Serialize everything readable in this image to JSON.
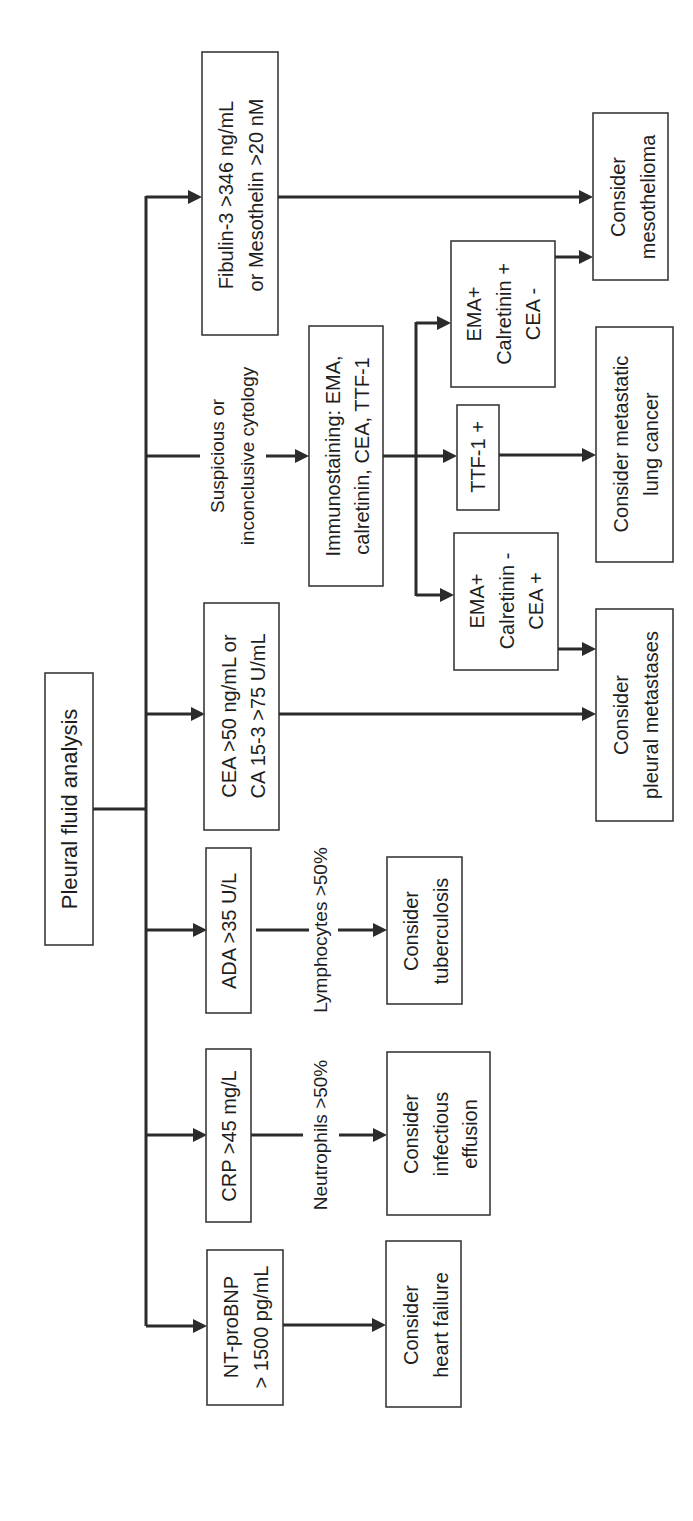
{
  "diagram": {
    "orientation": "rotated-90-ccw",
    "root": {
      "label": "Pleural fluid analysis"
    },
    "branches": [
      {
        "test": [
          "NT-proBNP",
          "> 1500 pg/mL"
        ],
        "edge_label": "",
        "outcome": [
          "Consider",
          "heart failure"
        ]
      },
      {
        "test": [
          "CRP >45 mg/L"
        ],
        "edge_label": "Neutrophils >50%",
        "outcome": [
          "Consider",
          "infectious",
          "effusion"
        ]
      },
      {
        "test": [
          "ADA >35 U/L"
        ],
        "edge_label": "Lymphocytes >50%",
        "outcome": [
          "Consider",
          "tuberculosis"
        ]
      },
      {
        "test": [
          "CEA >50 ng/mL or",
          "CA 15-3 >75 U/mL"
        ],
        "edge_label": "",
        "outcome": [
          "Consider",
          "pleural metastases"
        ]
      },
      {
        "test": [],
        "edge_label": [
          "Suspicious or",
          "inconclusive cytology"
        ],
        "next": [
          "Immunostaining: EMA,",
          "calretinin, CEA, TTF-1"
        ],
        "sub_branches": [
          {
            "result": [
              "EMA+",
              "Calretinin -",
              "CEA +"
            ],
            "outcome": "Consider pleural metastases"
          },
          {
            "result": [
              "TTF-1 +"
            ],
            "outcome": "Consider metastatic lung cancer"
          },
          {
            "result": [
              "EMA+",
              "Calretinin +",
              "CEA -"
            ],
            "outcome": "Consider mesothelioma"
          }
        ]
      },
      {
        "test": [
          "Fibulin-3 >346 ng/mL",
          "or Mesothelin >20 nM"
        ],
        "edge_label": "",
        "outcome": [
          "Consider",
          "mesothelioma"
        ]
      }
    ],
    "outcomes": {
      "metastatic_lung": [
        "Consider metastatic",
        "lung cancer"
      ]
    }
  }
}
